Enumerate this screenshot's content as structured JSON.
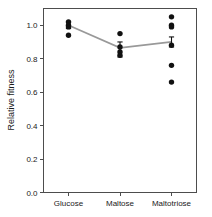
{
  "chart_data": {
    "type": "scatter",
    "title": "",
    "xlabel": "",
    "ylabel": "Relative fitness",
    "categories": [
      "Glucose",
      "Maltose",
      "Maltotriose"
    ],
    "ylim": [
      0.0,
      1.1
    ],
    "y_ticks": [
      0.0,
      0.2,
      0.4,
      0.6,
      0.8,
      1.0
    ],
    "y_tick_labels": [
      "0.0",
      "0.2",
      "0.4",
      "0.6",
      "0.8",
      "1.0"
    ],
    "grid": false,
    "legend": "none",
    "series": [
      {
        "name": "Glucose",
        "points": [
          1.02,
          1.0,
          0.99,
          0.94
        ],
        "mean": 1.0,
        "err_low": 0.98,
        "err_high": 1.02
      },
      {
        "name": "Maltose",
        "points": [
          0.95,
          0.87,
          0.84,
          0.82
        ],
        "mean": 0.865,
        "err_low": 0.81,
        "err_high": 0.9
      },
      {
        "name": "Maltotriose",
        "points": [
          1.05,
          1.0,
          0.99,
          0.88,
          0.76,
          0.66
        ],
        "mean": 0.9,
        "err_low": 0.87,
        "err_high": 0.93
      }
    ],
    "mean_line": {
      "values": [
        1.0,
        0.865,
        0.9
      ],
      "color": "#999999"
    },
    "point_color": "#111111",
    "axis_color": "#4d4d4d"
  }
}
